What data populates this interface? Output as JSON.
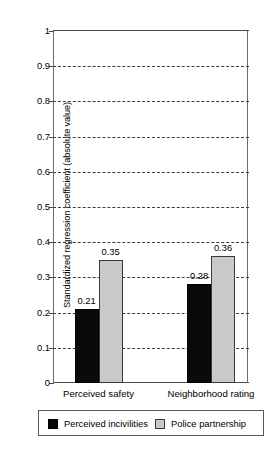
{
  "chart_data": {
    "type": "bar",
    "title": "",
    "xlabel": "",
    "ylabel": "Standardized regression coefficient (absolute value)",
    "ylim": [
      0,
      1
    ],
    "ytick_labels": [
      "1",
      "0.9",
      "0.8",
      "0.7",
      "0.6",
      "0.5",
      "0.4",
      "0.3",
      "0.2",
      "0.1",
      "0"
    ],
    "ytick_values": [
      1,
      0.9,
      0.8,
      0.7,
      0.6,
      0.5,
      0.4,
      0.3,
      0.2,
      0.1,
      0
    ],
    "grid": "horizontal-dashed",
    "legend_position": "below-axes",
    "categories": [
      "Perceived safety",
      "Neighborhood rating"
    ],
    "series": [
      {
        "name": "Perceived incivilities",
        "color": "#0a0a0a",
        "values": [
          0.21,
          0.28
        ],
        "labels": [
          "0.21",
          "0.28"
        ]
      },
      {
        "name": "Police partnership",
        "color": "#c9c9c9",
        "values": [
          0.35,
          0.36
        ],
        "labels": [
          "0.35",
          "0.36"
        ]
      }
    ]
  },
  "legend": {
    "items": [
      {
        "label": "Perceived incivilities",
        "swatch": "dark-square-icon"
      },
      {
        "label": "Police partnership",
        "swatch": "light-square-icon"
      }
    ]
  }
}
